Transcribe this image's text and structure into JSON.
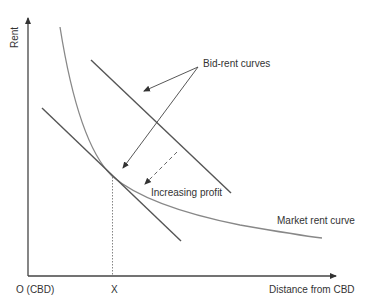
{
  "diagram": {
    "axes": {
      "y_label": "Rent",
      "x_label": "Distance from CBD",
      "origin_label": "O (CBD)",
      "x_point_label": "X"
    },
    "labels": {
      "bid_rent": "Bid-rent curves",
      "increasing_profit": "Increasing profit",
      "market_rent": "Market rent curve"
    },
    "colors": {
      "axis": "#444444",
      "bid_rent_line": "#555555",
      "market_curve": "#888888",
      "text": "#333333"
    }
  }
}
